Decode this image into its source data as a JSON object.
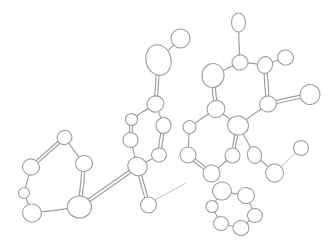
{
  "figure": {
    "kind": "chemical-structure-diagram",
    "background_color": "#ffffff",
    "stroke_color": "#9d9d9d",
    "thin_stroke_color": "#b4b4b4",
    "atom_fill_color": "#ffffff",
    "width": 336,
    "height": 241
  },
  "structure": {
    "atoms": [
      {
        "id": "a1",
        "cx": 64.5,
        "cy": 137.5,
        "rx": 7.5,
        "ry": 7.0,
        "rot": -20
      },
      {
        "id": "a2",
        "cx": 31.0,
        "cy": 167.0,
        "rx": 8.5,
        "ry": 8.0,
        "rot": 25
      },
      {
        "id": "a3",
        "cx": 24.0,
        "cy": 193.0,
        "rx": 5.5,
        "ry": 5.5,
        "rot": 0
      },
      {
        "id": "a4",
        "cx": 32.0,
        "cy": 213.0,
        "rx": 9.5,
        "ry": 9.0,
        "rot": 15
      },
      {
        "id": "a5",
        "cx": 79.5,
        "cy": 207.0,
        "rx": 12.0,
        "ry": 11.0,
        "rot": 0
      },
      {
        "id": "a6",
        "cx": 84.0,
        "cy": 163.5,
        "rx": 8.5,
        "ry": 8.0,
        "rot": -15
      },
      {
        "id": "a7",
        "cx": 137.5,
        "cy": 166.5,
        "rx": 10.0,
        "ry": 9.0,
        "rot": 30
      },
      {
        "id": "a8",
        "cx": 130.5,
        "cy": 140.0,
        "rx": 7.5,
        "ry": 7.5,
        "rot": 0
      },
      {
        "id": "a9",
        "cx": 131.5,
        "cy": 119.5,
        "rx": 6.0,
        "ry": 6.0,
        "rot": 0
      },
      {
        "id": "a10",
        "cx": 155.5,
        "cy": 104.0,
        "rx": 8.5,
        "ry": 8.0,
        "rot": -20
      },
      {
        "id": "a11",
        "cx": 163.5,
        "cy": 125.5,
        "rx": 7.5,
        "ry": 8.0,
        "rot": 10
      },
      {
        "id": "a12",
        "cx": 159.0,
        "cy": 155.0,
        "rx": 7.5,
        "ry": 7.0,
        "rot": 0
      },
      {
        "id": "a13",
        "cx": 158.5,
        "cy": 60.0,
        "rx": 12.5,
        "ry": 15.5,
        "rot": -15
      },
      {
        "id": "a14",
        "cx": 180.5,
        "cy": 38.5,
        "rx": 9.5,
        "ry": 9.5,
        "rot": 0
      },
      {
        "id": "a15",
        "cx": 148.5,
        "cy": 205.0,
        "rx": 8.0,
        "ry": 8.0,
        "rot": 0
      },
      {
        "id": "a16",
        "cx": 240.0,
        "cy": 62.5,
        "rx": 8.0,
        "ry": 7.5,
        "rot": -10
      },
      {
        "id": "a17",
        "cx": 238.5,
        "cy": 22.5,
        "rx": 7.0,
        "ry": 9.5,
        "rot": 0
      },
      {
        "id": "a18",
        "cx": 265.0,
        "cy": 65.0,
        "rx": 7.5,
        "ry": 8.5,
        "rot": 20
      },
      {
        "id": "a19",
        "cx": 285.5,
        "cy": 57.5,
        "rx": 8.0,
        "ry": 7.5,
        "rot": 15
      },
      {
        "id": "a20",
        "cx": 268.0,
        "cy": 104.0,
        "rx": 8.5,
        "ry": 8.0,
        "rot": -10
      },
      {
        "id": "a21",
        "cx": 310.0,
        "cy": 94.5,
        "rx": 10.0,
        "ry": 10.0,
        "rot": -25
      },
      {
        "id": "a22",
        "cx": 213.0,
        "cy": 75.5,
        "rx": 11.0,
        "ry": 12.0,
        "rot": 10
      },
      {
        "id": "a23",
        "cx": 216.0,
        "cy": 109.0,
        "rx": 9.0,
        "ry": 8.5,
        "rot": -20
      },
      {
        "id": "a24",
        "cx": 238.0,
        "cy": 125.5,
        "rx": 10.5,
        "ry": 9.5,
        "rot": 10
      },
      {
        "id": "a25",
        "cx": 189.5,
        "cy": 127.0,
        "rx": 6.5,
        "ry": 6.5,
        "rot": 0
      },
      {
        "id": "a26",
        "cx": 188.0,
        "cy": 155.0,
        "rx": 8.0,
        "ry": 8.0,
        "rot": 0
      },
      {
        "id": "a27",
        "cx": 211.5,
        "cy": 173.5,
        "rx": 8.5,
        "ry": 8.5,
        "rot": 15
      },
      {
        "id": "a28",
        "cx": 232.5,
        "cy": 155.5,
        "rx": 7.5,
        "ry": 7.5,
        "rot": 0
      },
      {
        "id": "a29",
        "cx": 254.5,
        "cy": 155.0,
        "rx": 7.0,
        "ry": 8.5,
        "rot": -15
      },
      {
        "id": "a30",
        "cx": 274.5,
        "cy": 173.0,
        "rx": 9.0,
        "ry": 9.0,
        "rot": 20
      },
      {
        "id": "a31",
        "cx": 301.0,
        "cy": 148.0,
        "rx": 7.5,
        "ry": 7.5,
        "rot": 0
      },
      {
        "id": "a32",
        "cx": 222.0,
        "cy": 191.0,
        "rx": 9.5,
        "ry": 9.0,
        "rot": -15
      },
      {
        "id": "a33",
        "cx": 246.0,
        "cy": 195.5,
        "rx": 8.5,
        "ry": 8.0,
        "rot": 10
      },
      {
        "id": "a34",
        "cx": 255.0,
        "cy": 215.5,
        "rx": 7.5,
        "ry": 7.0,
        "rot": 0
      },
      {
        "id": "a35",
        "cx": 241.0,
        "cy": 228.0,
        "rx": 8.0,
        "ry": 7.5,
        "rot": 15
      },
      {
        "id": "a36",
        "cx": 221.0,
        "cy": 223.5,
        "rx": 7.5,
        "ry": 7.0,
        "rot": 0
      },
      {
        "id": "a37",
        "cx": 212.0,
        "cy": 206.5,
        "rx": 6.0,
        "ry": 6.0,
        "rot": 0
      }
    ],
    "bonds": [
      {
        "from": "a1",
        "to": "a2",
        "order": 2,
        "style": "normal"
      },
      {
        "from": "a2",
        "to": "a3",
        "order": 1,
        "style": "normal"
      },
      {
        "from": "a3",
        "to": "a4",
        "order": 1,
        "style": "normal"
      },
      {
        "from": "a4",
        "to": "a5",
        "order": 1,
        "style": "normal"
      },
      {
        "from": "a5",
        "to": "a6",
        "order": 2,
        "style": "normal"
      },
      {
        "from": "a6",
        "to": "a1",
        "order": 1,
        "style": "normal"
      },
      {
        "from": "a5",
        "to": "a7",
        "order": 1,
        "style": "long-double"
      },
      {
        "from": "a7",
        "to": "a8",
        "order": 1,
        "style": "normal"
      },
      {
        "from": "a8",
        "to": "a9",
        "order": 2,
        "style": "normal"
      },
      {
        "from": "a9",
        "to": "a10",
        "order": 1,
        "style": "normal"
      },
      {
        "from": "a10",
        "to": "a11",
        "order": 1,
        "style": "normal"
      },
      {
        "from": "a11",
        "to": "a12",
        "order": 2,
        "style": "normal"
      },
      {
        "from": "a12",
        "to": "a7",
        "order": 1,
        "style": "normal"
      },
      {
        "from": "a10",
        "to": "a13",
        "order": 2,
        "style": "normal"
      },
      {
        "from": "a13",
        "to": "a14",
        "order": 1,
        "style": "normal"
      },
      {
        "from": "a7",
        "to": "a15",
        "order": 2,
        "style": "normal"
      },
      {
        "from": "a15",
        "to": "a15b",
        "order": 1,
        "style": "stub"
      },
      {
        "from": "a16",
        "to": "a17",
        "order": 1,
        "style": "normal"
      },
      {
        "from": "a16",
        "to": "a18",
        "order": 1,
        "style": "normal"
      },
      {
        "from": "a18",
        "to": "a19",
        "order": 1,
        "style": "normal"
      },
      {
        "from": "a18",
        "to": "a20",
        "order": 2,
        "style": "normal"
      },
      {
        "from": "a20",
        "to": "a21",
        "order": 2,
        "style": "normal"
      },
      {
        "from": "a20",
        "to": "a24",
        "order": 1,
        "style": "normal"
      },
      {
        "from": "a16",
        "to": "a22",
        "order": 1,
        "style": "normal"
      },
      {
        "from": "a22",
        "to": "a23",
        "order": 2,
        "style": "normal"
      },
      {
        "from": "a23",
        "to": "a24",
        "order": 1,
        "style": "normal"
      },
      {
        "from": "a23",
        "to": "a25",
        "order": 1,
        "style": "normal"
      },
      {
        "from": "a25",
        "to": "a26",
        "order": 1,
        "style": "normal"
      },
      {
        "from": "a26",
        "to": "a27",
        "order": 2,
        "style": "normal"
      },
      {
        "from": "a27",
        "to": "a28",
        "order": 1,
        "style": "normal"
      },
      {
        "from": "a28",
        "to": "a24",
        "order": 2,
        "style": "normal"
      },
      {
        "from": "a24",
        "to": "a29",
        "order": 1,
        "style": "normal"
      },
      {
        "from": "a29",
        "to": "a30",
        "order": 1,
        "style": "normal"
      },
      {
        "from": "a30",
        "to": "a31",
        "order": 1,
        "style": "thin"
      },
      {
        "from": "a32",
        "to": "a33",
        "order": 1,
        "style": "normal"
      },
      {
        "from": "a33",
        "to": "a34",
        "order": 1,
        "style": "normal"
      },
      {
        "from": "a34",
        "to": "a35",
        "order": 1,
        "style": "normal"
      },
      {
        "from": "a35",
        "to": "a36",
        "order": 1,
        "style": "normal"
      },
      {
        "from": "a36",
        "to": "a37",
        "order": 1,
        "style": "normal"
      },
      {
        "from": "a37",
        "to": "a32",
        "order": 1,
        "style": "normal"
      }
    ],
    "stub_lines": [
      {
        "id": "s1",
        "x1": 155.0,
        "y1": 200.0,
        "x2": 186.0,
        "y2": 183.0
      }
    ],
    "fragments": [
      {
        "name": "left-ring",
        "label": "six-membered ring (left)"
      },
      {
        "name": "center-ring",
        "label": "six-membered ring (center)"
      },
      {
        "name": "carbonyl-group",
        "label": "carbonyl branch (top center)"
      },
      {
        "name": "upper-right-ring",
        "label": "six-membered ring (upper right)"
      },
      {
        "name": "lower-right-ring",
        "label": "six-membered ring (lower right)"
      },
      {
        "name": "detached-ring",
        "label": "six-membered ring (bottom right, detached)"
      }
    ]
  }
}
